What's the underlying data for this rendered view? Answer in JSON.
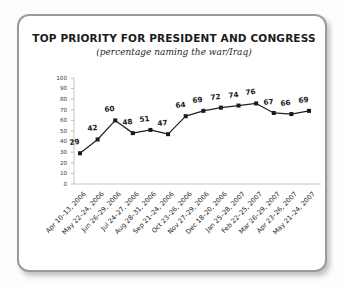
{
  "card": {
    "border_color": "#9b9b9b",
    "background": "#ffffff"
  },
  "chart_data": {
    "type": "line",
    "title": "TOP PRIORITY FOR PRESIDENT AND CONGRESS",
    "subtitle": "(percentage naming the war/Iraq)",
    "xlabel": "",
    "ylabel": "",
    "ylim": [
      0,
      100
    ],
    "yticks": [
      0,
      10,
      20,
      30,
      40,
      50,
      60,
      70,
      80,
      90,
      100
    ],
    "ytick_labels": [
      "0",
      "10",
      "20",
      "30",
      "40",
      "50",
      "60",
      "70",
      "80",
      "90",
      "100"
    ],
    "grid": false,
    "legend": false,
    "line_color": "#222222",
    "marker": "square",
    "marker_color": "#1a1a1a",
    "categories": [
      "Apr 10–13, 2006",
      "May 22–24, 2006",
      "Jun 26–29, 2006",
      "Jul 24–27, 2006",
      "Aug 28–31, 2006",
      "Sep 21–24, 2006",
      "Oct 23–26, 2006",
      "Nov 27–29, 2006",
      "Dec 18–20, 2006",
      "Jan 25–28, 2007",
      "Feb 22–25, 2007",
      "Mar 26–29, 2007",
      "Apr 23–26, 2007",
      "May 21–24, 2007"
    ],
    "values": [
      29,
      42,
      60,
      48,
      51,
      47,
      64,
      69,
      72,
      74,
      76,
      67,
      66,
      69
    ],
    "data_labels": [
      "29",
      "42",
      "60",
      "48",
      "51",
      "47",
      "64",
      "69",
      "72",
      "74",
      "76",
      "67",
      "66",
      "69"
    ]
  }
}
